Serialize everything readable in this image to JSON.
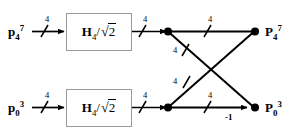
{
  "figure": {
    "type": "signal-flow-butterfly-diagram",
    "background_color": "#ffffff",
    "line_color": "#000000",
    "block_border_color": "#9a9a9a"
  },
  "blocks": [
    {
      "id": "transform-top",
      "operator": "H",
      "operator_subscript": "4",
      "divider": "/",
      "radical_symbol": "√",
      "radical_operand": "2",
      "full_text": "H4 / √2"
    },
    {
      "id": "transform-bottom",
      "operator": "H",
      "operator_subscript": "4",
      "divider": "/",
      "radical_symbol": "√",
      "radical_operand": "2",
      "full_text": "H4 / √2"
    }
  ],
  "inputs": [
    {
      "id": "input-top",
      "symbol": "p",
      "subscript": "4",
      "superscript": "7",
      "bus_width": "4"
    },
    {
      "id": "input-bottom",
      "symbol": "p",
      "subscript": "0",
      "superscript": "3",
      "bus_width": "4"
    }
  ],
  "outputs": [
    {
      "id": "output-top",
      "symbol": "P",
      "subscript": "4",
      "superscript": "7"
    },
    {
      "id": "output-bottom",
      "symbol": "P",
      "subscript": "0",
      "superscript": "3"
    }
  ],
  "bus_widths": {
    "input_top": "4",
    "input_bottom": "4",
    "block_out_top": "4",
    "block_out_bottom": "4",
    "cross_top": "4",
    "diag_upper": "4",
    "diag_lower": "4",
    "cross_bottom": "4"
  },
  "gains": {
    "bottom_branch": "-1"
  }
}
